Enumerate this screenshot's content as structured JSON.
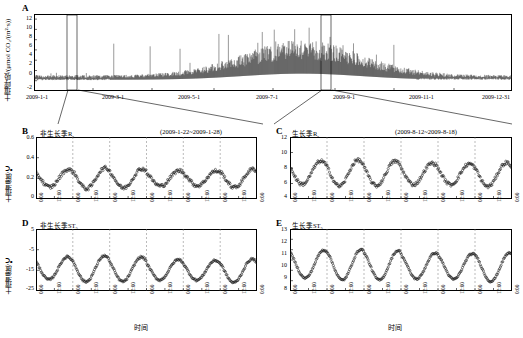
{
  "figure": {
    "panels": [
      "A",
      "B",
      "C",
      "D",
      "E"
    ]
  },
  "chart_data": [
    {
      "id": "A",
      "type": "line",
      "title": "A",
      "ylabel": "土壤呼吸/(μmol CO₂/(m²·s))",
      "xlabel": "",
      "ylim": [
        -2,
        13
      ],
      "yticks": [
        "-2",
        "0",
        "2",
        "4",
        "6",
        "8",
        "10",
        "12"
      ],
      "xticks": [
        "2009-1-1",
        "2009-3-1",
        "2009-5-1",
        "2009-7-1",
        "2009-9-1",
        "2009-11-1",
        "2009-12-31"
      ],
      "grid": false,
      "legend": "",
      "note": "全年土壤呼吸高频时间序列，冬季低值夏季高值",
      "highlight_windows": [
        "2009-1-22~2009-1-28",
        "2009-8-12~2009-8-18"
      ]
    },
    {
      "id": "B",
      "type": "scatter",
      "title": "非生长季R_s",
      "annotation": "(2009-1-22~2009-1-28)",
      "ylabel": "土壤温度/℃",
      "xlabel": "时间",
      "ylim": [
        0,
        0.6
      ],
      "yticks": [
        "0",
        "0.2",
        "0.4",
        "0.6"
      ],
      "xticks": [
        "0:00",
        "12:00",
        "0:00",
        "12:00",
        "0:00",
        "12:00",
        "0:00",
        "12:00",
        "0:00",
        "12:00",
        "0:00",
        "12:00",
        "0:00"
      ],
      "grid": true
    },
    {
      "id": "C",
      "type": "scatter",
      "title": "生长季R_s",
      "annotation": "(2009-8-12~2009-8-18)",
      "ylabel": "",
      "xlabel": "时间",
      "ylim": [
        4,
        12
      ],
      "yticks": [
        "4",
        "6",
        "8",
        "10",
        "12"
      ],
      "xticks": [
        "0:00",
        "12:00",
        "0:00",
        "12:00",
        "0:00",
        "12:00",
        "0:00",
        "12:00",
        "0:00",
        "12:00",
        "0:00",
        "12:00",
        "0:00"
      ],
      "grid": true
    },
    {
      "id": "D",
      "type": "scatter",
      "title": "非生长季ST₅",
      "annotation": "",
      "ylabel": "土壤温度/℃",
      "xlabel": "时间",
      "ylim": [
        -25,
        5
      ],
      "yticks": [
        "5",
        "-5",
        "-15",
        "-25"
      ],
      "xticks": [
        "0:00",
        "12:00",
        "0:00",
        "12:00",
        "0:00",
        "12:00",
        "0:00",
        "12:00",
        "0:00",
        "12:00",
        "0:00",
        "12:00",
        "0:00"
      ],
      "grid": true
    },
    {
      "id": "E",
      "type": "scatter",
      "title": "生长季ST₅",
      "annotation": "",
      "ylabel": "",
      "xlabel": "时间",
      "ylim": [
        8,
        14
      ],
      "yticks": [
        "8",
        "9",
        "10",
        "11",
        "12",
        "13"
      ],
      "xticks": [
        "0:00",
        "12:00",
        "0:00",
        "12:00",
        "0:00",
        "12:00",
        "0:00",
        "12:00",
        "0:00",
        "12:00",
        "0:00",
        "12:00",
        "0:00"
      ],
      "grid": true
    }
  ],
  "labels": {
    "panel_a": "A",
    "panel_b": "B",
    "panel_c": "C",
    "panel_d": "D",
    "panel_e": "E",
    "a_ylabel": "土壤呼吸/(μmol CO₂/(m²·s))",
    "b_title": "非生长季R",
    "b_sub": "s",
    "b_ann": "(2009-1-22~2009-1-28)",
    "c_title": "生长季R",
    "c_sub": "s",
    "c_ann": "(2009-8-12~2009-8-18)",
    "d_title": "非生长季ST",
    "d_sub": "5",
    "e_title": "生长季ST",
    "e_sub": "5",
    "ylabel_temp": "土壤温度/℃",
    "xlabel_time": "时间"
  }
}
